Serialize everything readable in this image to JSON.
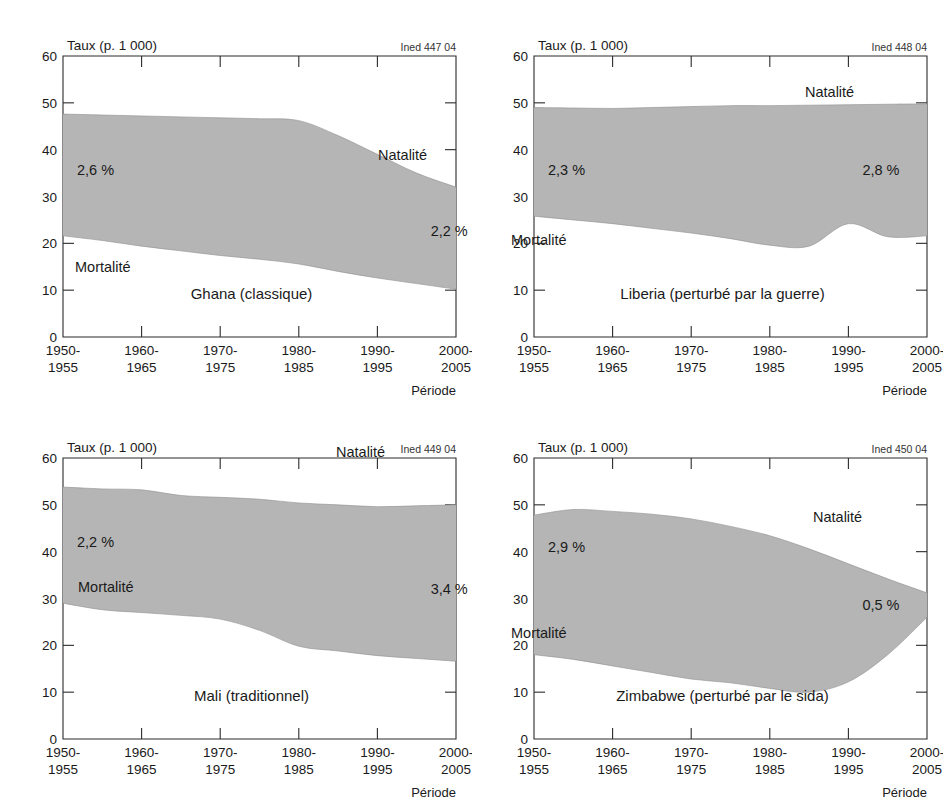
{
  "figure": {
    "axis_unit_label": "Taux (p. 1 000)",
    "x_axis_title": "Période",
    "series_labels": {
      "birth": "Natalité",
      "death": "Mortalité"
    },
    "y_ticks": [
      "0",
      "10",
      "20",
      "30",
      "40",
      "50",
      "60"
    ],
    "x_tick_lines": [
      [
        "1950-",
        "1955"
      ],
      [
        "1960-",
        "1965"
      ],
      [
        "1970-",
        "1975"
      ],
      [
        "1980-",
        "1985"
      ],
      [
        "1990-",
        "1995"
      ],
      [
        "2000-",
        "2005"
      ]
    ],
    "colors": {
      "area_fill": "#b5b5b5",
      "axis": "#2b2b2b",
      "text": "#1a1a1a",
      "background": "#ffffff"
    }
  },
  "chart_data": [
    {
      "type": "area",
      "panel": 0,
      "title": "Ghana (classique)",
      "ined_code": "Ined 447 04",
      "xlabel": "Période",
      "ylabel": "Taux (p. 1 000)",
      "ylim": [
        0,
        60
      ],
      "grid": false,
      "categories": [
        "1950-1955",
        "1955-1960",
        "1960-1965",
        "1965-1970",
        "1970-1975",
        "1975-1980",
        "1980-1985",
        "1985-1990",
        "1990-1995",
        "1995-2000",
        "2000-2005"
      ],
      "series": [
        {
          "name": "Natalité",
          "values": [
            47.6,
            47.4,
            47.2,
            47.0,
            46.8,
            46.6,
            46.2,
            43.0,
            39.0,
            35.0,
            32.0
          ]
        },
        {
          "name": "Mortalité",
          "values": [
            21.6,
            20.6,
            19.4,
            18.4,
            17.4,
            16.6,
            15.6,
            14.0,
            12.6,
            11.4,
            10.2
          ]
        }
      ],
      "annotations": [
        {
          "text": "2,6 %",
          "x": "1950-1955",
          "value": 34.5
        },
        {
          "text": "2,2 %",
          "x": "1995-2000",
          "value": 21.5
        }
      ]
    },
    {
      "type": "area",
      "panel": 1,
      "title": "Liberia (perturbé par la guerre)",
      "ined_code": "Ined 448 04",
      "xlabel": "Période",
      "ylabel": "Taux (p. 1 000)",
      "ylim": [
        0,
        60
      ],
      "grid": false,
      "categories": [
        "1950-1955",
        "1955-1960",
        "1960-1965",
        "1965-1970",
        "1970-1975",
        "1975-1980",
        "1980-1985",
        "1985-1990",
        "1990-1995",
        "1995-2000",
        "2000-2005"
      ],
      "series": [
        {
          "name": "Natalité",
          "values": [
            49.0,
            48.9,
            48.8,
            49.0,
            49.2,
            49.4,
            49.4,
            49.5,
            49.6,
            49.7,
            49.8
          ]
        },
        {
          "name": "Mortalité",
          "values": [
            25.8,
            25.0,
            24.2,
            23.2,
            22.2,
            21.0,
            19.6,
            19.4,
            24.2,
            21.4,
            21.6
          ]
        }
      ],
      "annotations": [
        {
          "text": "2,3 %",
          "x": "1950-1955",
          "value": 34.5
        },
        {
          "text": "2,8 %",
          "x": "1990-1995",
          "value": 34.5
        }
      ]
    },
    {
      "type": "area",
      "panel": 2,
      "title": "Mali (traditionnel)",
      "ined_code": "Ined 449 04",
      "xlabel": "Période",
      "ylabel": "Taux (p. 1 000)",
      "ylim": [
        0,
        60
      ],
      "grid": false,
      "categories": [
        "1950-1955",
        "1955-1960",
        "1960-1965",
        "1965-1970",
        "1970-1975",
        "1975-1980",
        "1980-1985",
        "1985-1990",
        "1990-1995",
        "1995-2000",
        "2000-2005"
      ],
      "series": [
        {
          "name": "Natalité",
          "values": [
            53.8,
            53.4,
            53.2,
            52.0,
            51.6,
            51.2,
            50.4,
            50.0,
            49.6,
            49.8,
            50.0
          ]
        },
        {
          "name": "Mortalité",
          "values": [
            29.0,
            27.6,
            27.0,
            26.4,
            25.6,
            23.2,
            19.8,
            18.8,
            17.8,
            17.2,
            16.6
          ]
        }
      ],
      "annotations": [
        {
          "text": "2,2 %",
          "x": "1950-1955",
          "value": 41.0
        },
        {
          "text": "3,4 %",
          "x": "1995-2000",
          "value": 31.0
        }
      ]
    },
    {
      "type": "area",
      "panel": 3,
      "title": "Zimbabwe (perturbé par le sida)",
      "ined_code": "Ined 450 04",
      "xlabel": "Période",
      "ylabel": "Taux (p. 1 000)",
      "ylim": [
        0,
        60
      ],
      "grid": false,
      "categories": [
        "1950-1955",
        "1955-1960",
        "1960-1965",
        "1965-1970",
        "1970-1975",
        "1975-1980",
        "1980-1985",
        "1985-1990",
        "1990-1995",
        "1995-2000",
        "2000-2005"
      ],
      "series": [
        {
          "name": "Natalité",
          "values": [
            47.8,
            49.0,
            48.6,
            48.0,
            47.0,
            45.4,
            43.4,
            40.6,
            37.4,
            34.2,
            31.2
          ]
        },
        {
          "name": "Mortalité",
          "values": [
            18.0,
            17.0,
            15.6,
            14.2,
            12.8,
            12.0,
            10.8,
            10.0,
            12.2,
            18.0,
            26.0
          ]
        }
      ],
      "annotations": [
        {
          "text": "2,9 %",
          "x": "1950-1955",
          "value": 40.0
        },
        {
          "text": "0,5 %",
          "x": "1990-1995",
          "value": 27.5
        }
      ]
    }
  ]
}
